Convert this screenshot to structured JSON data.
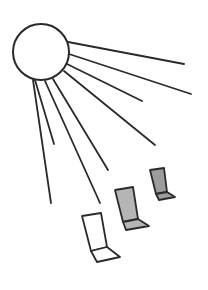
{
  "diagram": {
    "stroke_color": "#2a2a2a",
    "background": "#ffffff",
    "sun": {
      "icon": "sun-icon",
      "cx": 41,
      "cy": 52,
      "r": 28,
      "fill": "#ffffff"
    },
    "rays": [
      {
        "x1": 68,
        "y1": 42,
        "x2": 184,
        "y2": 64
      },
      {
        "x1": 69,
        "y1": 54,
        "x2": 191,
        "y2": 94
      },
      {
        "x1": 67,
        "y1": 64,
        "x2": 142,
        "y2": 101
      },
      {
        "x1": 64,
        "y1": 71,
        "x2": 155,
        "y2": 145
      },
      {
        "x1": 53,
        "y1": 79,
        "x2": 108,
        "y2": 170
      },
      {
        "x1": 45,
        "y1": 81,
        "x2": 100,
        "y2": 203
      },
      {
        "x1": 35,
        "y1": 80,
        "x2": 54,
        "y2": 144
      },
      {
        "x1": 33,
        "y1": 80,
        "x2": 51,
        "y2": 203
      }
    ],
    "chairs": [
      {
        "name": "chair-near-white",
        "fill": "#ffffff",
        "back": "82,216 101,213 107,247 91,251",
        "seat": "91,251 107,247 120,257 97,262"
      },
      {
        "name": "chair-middle-gray",
        "fill": "#b5b5b5",
        "back": "115,190 133,187 138,219 123,222",
        "seat": "123,222 138,219 149,226 126,230"
      },
      {
        "name": "chair-far-gray",
        "fill": "#9c9c9c",
        "back": "150,170 164,168 167,192 156,194",
        "seat": "156,194 167,192 175,197 159,200"
      }
    ]
  }
}
